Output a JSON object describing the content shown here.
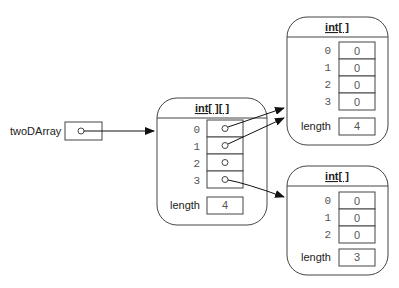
{
  "variable": {
    "name": "twoDArray"
  },
  "outer_array": {
    "type_label": "int[ ][ ]",
    "indices": [
      "0",
      "1",
      "2",
      "3"
    ],
    "length_label": "length",
    "length_value": "4"
  },
  "inner_array_a": {
    "type_label": "int[ ]",
    "indices": [
      "0",
      "1",
      "2",
      "3"
    ],
    "values": [
      "0",
      "0",
      "0",
      "0"
    ],
    "length_label": "length",
    "length_value": "4"
  },
  "inner_array_b": {
    "type_label": "int[ ]",
    "indices": [
      "0",
      "1",
      "2"
    ],
    "values": [
      "0",
      "0",
      "0"
    ],
    "length_label": "length",
    "length_value": "3"
  }
}
